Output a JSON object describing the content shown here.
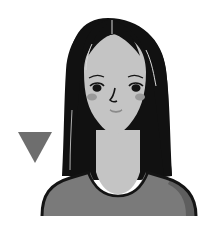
{
  "illustration": {
    "subject": "woman-portrait",
    "colors": {
      "background": "#ffffff",
      "hair": "#111111",
      "skin": "#c4c4c4",
      "shirt": "#7a7a7a",
      "shirt_shadow": "#5e5e5e",
      "outline": "#141414",
      "blush": "#9a9a9a",
      "mouth": "#8a8a8a",
      "triangle": "#6e6e6e",
      "hair_highlight": "#d8d8d8"
    },
    "marker": {
      "shape": "down-triangle"
    }
  }
}
